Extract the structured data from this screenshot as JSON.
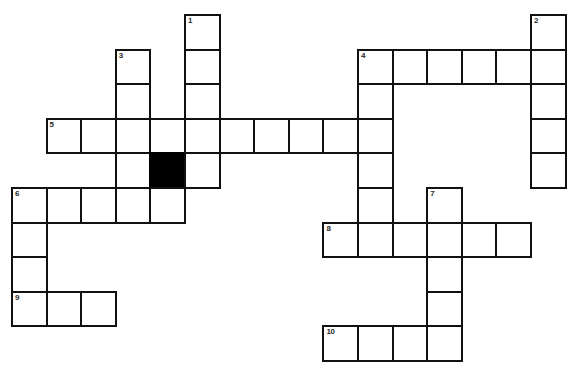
{
  "puzzle": {
    "kind": "crossword-grid",
    "title": "",
    "geometry": {
      "image_width": 573,
      "image_height": 383,
      "cell_size": 34.6,
      "origin_x": 11,
      "origin_y": 14,
      "columns": 16,
      "rows": 10,
      "line_color": "#111111",
      "block_color": "#000000",
      "background_color": "#ffffff",
      "number_color": "#2a2a2a"
    },
    "entries": [
      {
        "number": 1,
        "direction": "down",
        "row": 0,
        "col": 5,
        "length": 4
      },
      {
        "number": 2,
        "direction": "down",
        "row": 0,
        "col": 15,
        "length": 5
      },
      {
        "number": 3,
        "direction": "down",
        "row": 1,
        "col": 3,
        "length": 5
      },
      {
        "number": 4,
        "direction": "across",
        "row": 1,
        "col": 10,
        "length": 6
      },
      {
        "number": 4,
        "direction": "down",
        "row": 1,
        "col": 10,
        "length": 6
      },
      {
        "number": 5,
        "direction": "across",
        "row": 3,
        "col": 1,
        "length": 10
      },
      {
        "number": 6,
        "direction": "across",
        "row": 5,
        "col": 0,
        "length": 5
      },
      {
        "number": 6,
        "direction": "down",
        "row": 5,
        "col": 0,
        "length": 5
      },
      {
        "number": 7,
        "direction": "down",
        "row": 5,
        "col": 12,
        "length": 5
      },
      {
        "number": 8,
        "direction": "across",
        "row": 6,
        "col": 9,
        "length": 6
      },
      {
        "number": 9,
        "direction": "across",
        "row": 8,
        "col": 0,
        "length": 3
      },
      {
        "number": 10,
        "direction": "across",
        "row": 9,
        "col": 9,
        "length": 4
      }
    ],
    "cells": [
      {
        "row": 0,
        "col": 5,
        "number": "1",
        "block": false
      },
      {
        "row": 0,
        "col": 15,
        "number": "2",
        "block": false
      },
      {
        "row": 1,
        "col": 3,
        "number": "3",
        "block": false
      },
      {
        "row": 1,
        "col": 5,
        "number": "",
        "block": false
      },
      {
        "row": 1,
        "col": 10,
        "number": "4",
        "block": false
      },
      {
        "row": 1,
        "col": 11,
        "number": "",
        "block": false
      },
      {
        "row": 1,
        "col": 12,
        "number": "",
        "block": false
      },
      {
        "row": 1,
        "col": 13,
        "number": "",
        "block": false
      },
      {
        "row": 1,
        "col": 14,
        "number": "",
        "block": false
      },
      {
        "row": 1,
        "col": 15,
        "number": "",
        "block": false
      },
      {
        "row": 2,
        "col": 3,
        "number": "",
        "block": false
      },
      {
        "row": 2,
        "col": 5,
        "number": "",
        "block": false
      },
      {
        "row": 2,
        "col": 10,
        "number": "",
        "block": false
      },
      {
        "row": 2,
        "col": 15,
        "number": "",
        "block": false
      },
      {
        "row": 3,
        "col": 1,
        "number": "5",
        "block": false
      },
      {
        "row": 3,
        "col": 2,
        "number": "",
        "block": false
      },
      {
        "row": 3,
        "col": 3,
        "number": "",
        "block": false
      },
      {
        "row": 3,
        "col": 4,
        "number": "",
        "block": false
      },
      {
        "row": 3,
        "col": 5,
        "number": "",
        "block": false
      },
      {
        "row": 3,
        "col": 6,
        "number": "",
        "block": false
      },
      {
        "row": 3,
        "col": 7,
        "number": "",
        "block": false
      },
      {
        "row": 3,
        "col": 8,
        "number": "",
        "block": false
      },
      {
        "row": 3,
        "col": 9,
        "number": "",
        "block": false
      },
      {
        "row": 3,
        "col": 10,
        "number": "",
        "block": false
      },
      {
        "row": 3,
        "col": 15,
        "number": "",
        "block": false
      },
      {
        "row": 4,
        "col": 3,
        "number": "",
        "block": false
      },
      {
        "row": 4,
        "col": 4,
        "number": "",
        "block": true
      },
      {
        "row": 4,
        "col": 5,
        "number": "",
        "block": false
      },
      {
        "row": 4,
        "col": 10,
        "number": "",
        "block": false
      },
      {
        "row": 4,
        "col": 15,
        "number": "",
        "block": false
      },
      {
        "row": 5,
        "col": 0,
        "number": "6",
        "block": false
      },
      {
        "row": 5,
        "col": 1,
        "number": "",
        "block": false
      },
      {
        "row": 5,
        "col": 2,
        "number": "",
        "block": false
      },
      {
        "row": 5,
        "col": 3,
        "number": "",
        "block": false
      },
      {
        "row": 5,
        "col": 4,
        "number": "",
        "block": false
      },
      {
        "row": 5,
        "col": 10,
        "number": "",
        "block": false
      },
      {
        "row": 5,
        "col": 12,
        "number": "7",
        "block": false
      },
      {
        "row": 6,
        "col": 0,
        "number": "",
        "block": false
      },
      {
        "row": 6,
        "col": 9,
        "number": "8",
        "block": false
      },
      {
        "row": 6,
        "col": 10,
        "number": "",
        "block": false
      },
      {
        "row": 6,
        "col": 11,
        "number": "",
        "block": false
      },
      {
        "row": 6,
        "col": 12,
        "number": "",
        "block": false
      },
      {
        "row": 6,
        "col": 13,
        "number": "",
        "block": false
      },
      {
        "row": 6,
        "col": 14,
        "number": "",
        "block": false
      },
      {
        "row": 7,
        "col": 0,
        "number": "",
        "block": false
      },
      {
        "row": 7,
        "col": 12,
        "number": "",
        "block": false
      },
      {
        "row": 8,
        "col": 0,
        "number": "9",
        "block": false
      },
      {
        "row": 8,
        "col": 1,
        "number": "",
        "block": false
      },
      {
        "row": 8,
        "col": 2,
        "number": "",
        "block": false
      },
      {
        "row": 8,
        "col": 12,
        "number": "",
        "block": false
      },
      {
        "row": 9,
        "col": 9,
        "number": "10",
        "block": false
      },
      {
        "row": 9,
        "col": 10,
        "number": "",
        "block": false
      },
      {
        "row": 9,
        "col": 11,
        "number": "",
        "block": false
      },
      {
        "row": 9,
        "col": 12,
        "number": "",
        "block": false
      }
    ]
  }
}
